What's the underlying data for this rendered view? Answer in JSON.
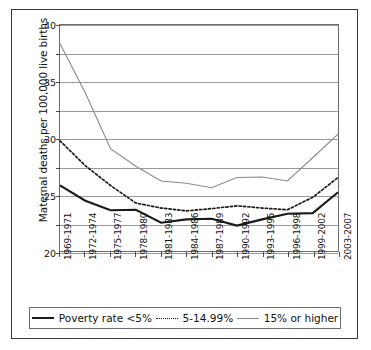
{
  "chart_data": {
    "type": "line",
    "title": "",
    "xlabel": "",
    "ylabel": "Maternal deaths per 100,000 live births",
    "ylim": [
      0,
      40
    ],
    "yticks": [
      0,
      5,
      10,
      15,
      20,
      25,
      30,
      35,
      40
    ],
    "grid": true,
    "legend_position": "bottom",
    "categories": [
      "1969-1971",
      "1972-1974",
      "1975-1977",
      "1978-1980",
      "1981-1983",
      "1984-1986",
      "1987-1989",
      "1990-1992",
      "1993-1995",
      "1996-1998",
      "1999-2002",
      "2003-2007"
    ],
    "series": [
      {
        "name": "Poverty rate <5%",
        "style": "solid-thick",
        "color": "#1a1a1a",
        "values": [
          11.6,
          8.9,
          7.2,
          7.3,
          5.0,
          5.6,
          5.7,
          4.5,
          5.6,
          6.6,
          6.7,
          10.4
        ]
      },
      {
        "name": "5-14.99%",
        "style": "dotted",
        "color": "#1a1a1a",
        "values": [
          19.5,
          15.1,
          11.6,
          8.5,
          7.6,
          7.1,
          7.5,
          8.0,
          7.6,
          7.3,
          9.5,
          13.0
        ]
      },
      {
        "name": "15% or higher",
        "style": "solid-thin",
        "color": "#8a8a8a",
        "values": [
          36.7,
          28.0,
          18.1,
          15.0,
          12.4,
          12.0,
          11.2,
          13.0,
          13.1,
          12.4,
          16.5,
          20.7
        ]
      }
    ]
  },
  "legend": {
    "items": [
      {
        "label": "Poverty rate <5%"
      },
      {
        "label": "5-14.99%"
      },
      {
        "label": "15% or higher"
      }
    ]
  }
}
